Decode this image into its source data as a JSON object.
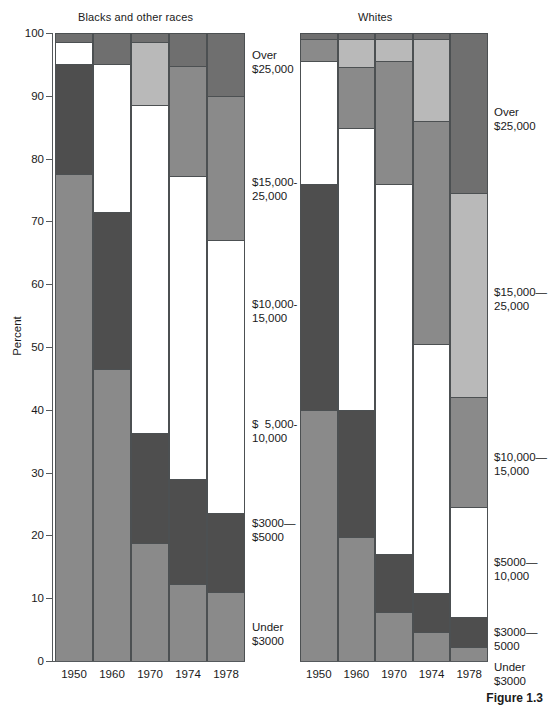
{
  "figure": {
    "caption": "Figure 1.3",
    "panels": [
      {
        "id": "left",
        "title": "Blacks and other races"
      },
      {
        "id": "right",
        "title": "Whites"
      }
    ]
  },
  "axes": {
    "ylabel": "Percent",
    "yticks": [
      "0",
      "10",
      "20",
      "30",
      "40",
      "50",
      "60",
      "70",
      "80",
      "90",
      "100"
    ],
    "ymin": 0,
    "ymax": 100,
    "xticks": [
      "1950",
      "1960",
      "1970",
      "1974",
      "1978"
    ]
  },
  "legend_center": [
    "Over\n$25,000",
    "$15,000-\n25,000",
    "$10,000-\n15,000",
    "$  5,000-\n10,000",
    "$3000—\n$5000",
    "Under\n$3000"
  ],
  "legend_right": [
    "Over\n$25,000",
    "$15,000—\n25,000",
    "$10,000—\n15,000",
    "$5000—\n10,000",
    "$3000—\n5000",
    "Under\n$3000"
  ],
  "colors": {
    "under3000": "#8a8a8a",
    "b3000_5000": "#4e4e4e",
    "b5000_10000": "#ffffff",
    "b10000_15000": "#8a8a8a",
    "b15000_25000": "#b9b9b9",
    "over25000": "#6f6f6f",
    "axis": "#55595c",
    "outline": "#4c5052",
    "text": "#1a1a1a",
    "background": "#ffffff"
  },
  "chart_data": {
    "type": "bar",
    "xlabel": "",
    "ylabel": "Percent",
    "ylim": [
      0,
      100
    ],
    "grid": false,
    "stacked": true,
    "legend_position": "right-of-panels",
    "categories": [
      "1950",
      "1960",
      "1970",
      "1974",
      "1978"
    ],
    "panels": [
      {
        "name": "Blacks and other races",
        "series": [
          {
            "name": "Under $3000",
            "color": "#8a8a8a",
            "values": [
              77.5,
              46.5,
              18.8,
              12.2,
              11.0
            ]
          },
          {
            "name": "$3000-$5000",
            "color": "#4e4e4e",
            "values": [
              17.5,
              25.0,
              17.5,
              16.8,
              12.5
            ]
          },
          {
            "name": "$5,000-10,000",
            "color": "#ffffff",
            "values": [
              3.5,
              23.5,
              52.2,
              48.0,
              43.5
            ]
          },
          {
            "name": "$10,000-15,000",
            "color": "#8a8a8a",
            "values": [
              0.0,
              0.0,
              0.0,
              20.3,
              17.0
            ]
          },
          {
            "name": "$15,000-25,000",
            "color": "#b9b9b9",
            "values": [
              0.0,
              0.0,
              10.0,
              0.0,
              10.0
            ]
          },
          {
            "name": "Over $25,000",
            "color": "#6f6f6f",
            "values": [
              1.5,
              5.0,
              1.5,
              2.7,
              6.0
            ]
          }
        ],
        "boundaries": {
          "1950": [
            0,
            77.5,
            95.0,
            98.5,
            98.5,
            98.5,
            100
          ],
          "1960": [
            0,
            46.5,
            71.5,
            95.0,
            95.0,
            95.0,
            100
          ],
          "1970": [
            0,
            18.8,
            36.3,
            88.5,
            88.5,
            98.5,
            100
          ],
          "1974": [
            0,
            12.2,
            29.0,
            77.3,
            94.8,
            94.8,
            100
          ],
          "1978": [
            0,
            11.0,
            23.5,
            67.0,
            90.0,
            90.0,
            100
          ]
        }
      },
      {
        "name": "Whites",
        "series": [
          {
            "name": "Under $3000",
            "color": "#8a8a8a",
            "values": [
              40.0,
              19.7,
              7.8,
              4.6,
              2.2
            ]
          },
          {
            "name": "$3000-5000",
            "color": "#4e4e4e",
            "values": [
              36.0,
              20.3,
              9.3,
              6.2,
              4.8
            ]
          },
          {
            "name": "$5000-10,000",
            "color": "#ffffff",
            "values": [
              19.5,
              44.8,
              58.9,
              39.7,
              17.5
            ]
          },
          {
            "name": "$10,000-15,000",
            "color": "#8a8a8a",
            "values": [
              3.5,
              9.8,
              19.5,
              35.5,
              32.5
            ]
          },
          {
            "name": "$15,000-25,000",
            "color": "#b9b9b9",
            "values": [
              0.0,
              4.4,
              3.5,
              13.0,
              42.0
            ]
          },
          {
            "name": "Over $25,000",
            "color": "#6f6f6f",
            "values": [
              1.0,
              1.0,
              1.0,
              1.0,
              1.0
            ]
          }
        ],
        "boundaries": {
          "1950": [
            0,
            40.0,
            76.0,
            95.5,
            99.0,
            99.0,
            100
          ],
          "1960": [
            0,
            19.7,
            40.0,
            84.8,
            94.6,
            99.0,
            100
          ],
          "1970": [
            0,
            7.8,
            17.1,
            76.0,
            95.5,
            99.0,
            100
          ],
          "1974": [
            0,
            4.6,
            10.8,
            50.5,
            86.0,
            99.0,
            100
          ],
          "1978": [
            0,
            2.2,
            7.0,
            24.5,
            42.0,
            74.5,
            100
          ]
        }
      }
    ]
  }
}
